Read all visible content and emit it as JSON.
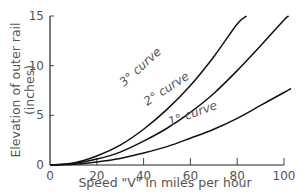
{
  "chart_data": {
    "type": "line",
    "title": "",
    "xlabel": "Speed \"V\" in miles per hour",
    "ylabel": "Elevation of outer rail",
    "ylabel_units": "(inches)",
    "xlim": [
      0,
      100
    ],
    "ylim": [
      0,
      15
    ],
    "x_ticks": [
      "0",
      "20",
      "40",
      "60",
      "80",
      "100"
    ],
    "y_ticks": [
      "0",
      "5",
      "10",
      "15"
    ],
    "grid": false,
    "legend": "inline labels on curves",
    "series": [
      {
        "name": "3° curve",
        "x": [
          0,
          10,
          20,
          30,
          40,
          50,
          60,
          70,
          80,
          84
        ],
        "values": [
          0,
          0.2,
          0.9,
          2.0,
          3.6,
          5.6,
          8.0,
          10.9,
          14.2,
          15.0
        ]
      },
      {
        "name": "2° curve",
        "x": [
          0,
          10,
          20,
          30,
          40,
          50,
          60,
          70,
          80,
          90,
          100,
          102
        ],
        "values": [
          0,
          0.14,
          0.6,
          1.3,
          2.4,
          3.7,
          5.3,
          7.2,
          9.5,
          12.0,
          14.6,
          15.0
        ]
      },
      {
        "name": "1° curve",
        "x": [
          0,
          10,
          20,
          30,
          40,
          50,
          60,
          70,
          80,
          90,
          100,
          103
        ],
        "values": [
          0,
          0.07,
          0.3,
          0.65,
          1.2,
          1.85,
          2.7,
          3.6,
          4.7,
          6.0,
          7.3,
          7.7
        ]
      }
    ]
  }
}
